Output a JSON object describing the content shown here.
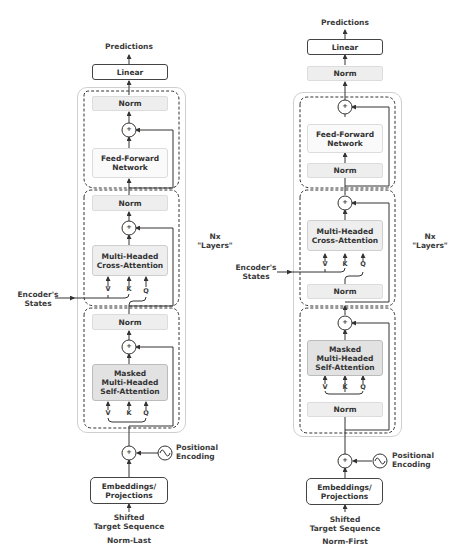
{
  "left": {
    "title": "Norm-Last",
    "predictions": "Predictions",
    "linear": "Linear",
    "norm_top": "Norm",
    "ffn": [
      "Feed-Forward",
      "Network"
    ],
    "norm_mid": "Norm",
    "cross_attention": [
      "Multi-Headed",
      "Cross-Attention"
    ],
    "norm_low": "Norm",
    "masked_attention": [
      "Masked",
      "Multi-Headed",
      "Self-Attention"
    ],
    "vkq": [
      "V",
      "K",
      "Q"
    ],
    "encoder_states": [
      "Encoder's",
      "States"
    ],
    "positional_encoding": [
      "Positional",
      "Encoding"
    ],
    "embeddings": [
      "Embeddings/",
      "Projections"
    ],
    "input": [
      "Shifted",
      "Target Sequence"
    ],
    "layers_label": [
      "Nx",
      "\"Layers\""
    ],
    "plus": "+"
  },
  "right": {
    "title": "Norm-First",
    "predictions": "Predictions",
    "linear": "Linear",
    "norm_final": "Norm",
    "ffn": [
      "Feed-Forward",
      "Network"
    ],
    "norm_ffn": "Norm",
    "cross_attention": [
      "Multi-Headed",
      "Cross-Attention"
    ],
    "norm_cross": "Norm",
    "masked_attention": [
      "Masked",
      "Multi-Headed",
      "Self-Attention"
    ],
    "norm_self": "Norm",
    "vkq": [
      "V",
      "K",
      "Q"
    ],
    "encoder_states": [
      "Encoder's",
      "States"
    ],
    "positional_encoding": [
      "Positional",
      "Encoding"
    ],
    "embeddings": [
      "Embeddings/",
      "Projections"
    ],
    "input": [
      "Shifted",
      "Target Sequence"
    ],
    "layers_label": [
      "Nx",
      "\"Layers\""
    ],
    "plus": "+"
  },
  "colors": {
    "line": "#333333",
    "norm_fill": "#eeeeee",
    "masked_fill": "#e2e2e2",
    "outer_border": "#cfcfcf"
  }
}
